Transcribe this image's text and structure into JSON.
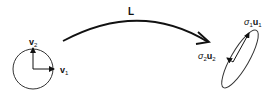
{
  "diagram": {
    "transform_label": "L",
    "domain": {
      "shape": "unit circle",
      "vector_1": {
        "name": "v",
        "subscript": "1"
      },
      "vector_2": {
        "name": "v",
        "subscript": "2"
      }
    },
    "codomain": {
      "shape": "ellipse",
      "axis_1": {
        "coef": "σ",
        "coef_sub": "1",
        "name": "u",
        "subscript": "1"
      },
      "axis_2": {
        "coef": "σ",
        "coef_sub": "2",
        "name": "u",
        "subscript": "2"
      }
    },
    "colors": {
      "stroke": "#111111",
      "background": "#ffffff"
    }
  }
}
